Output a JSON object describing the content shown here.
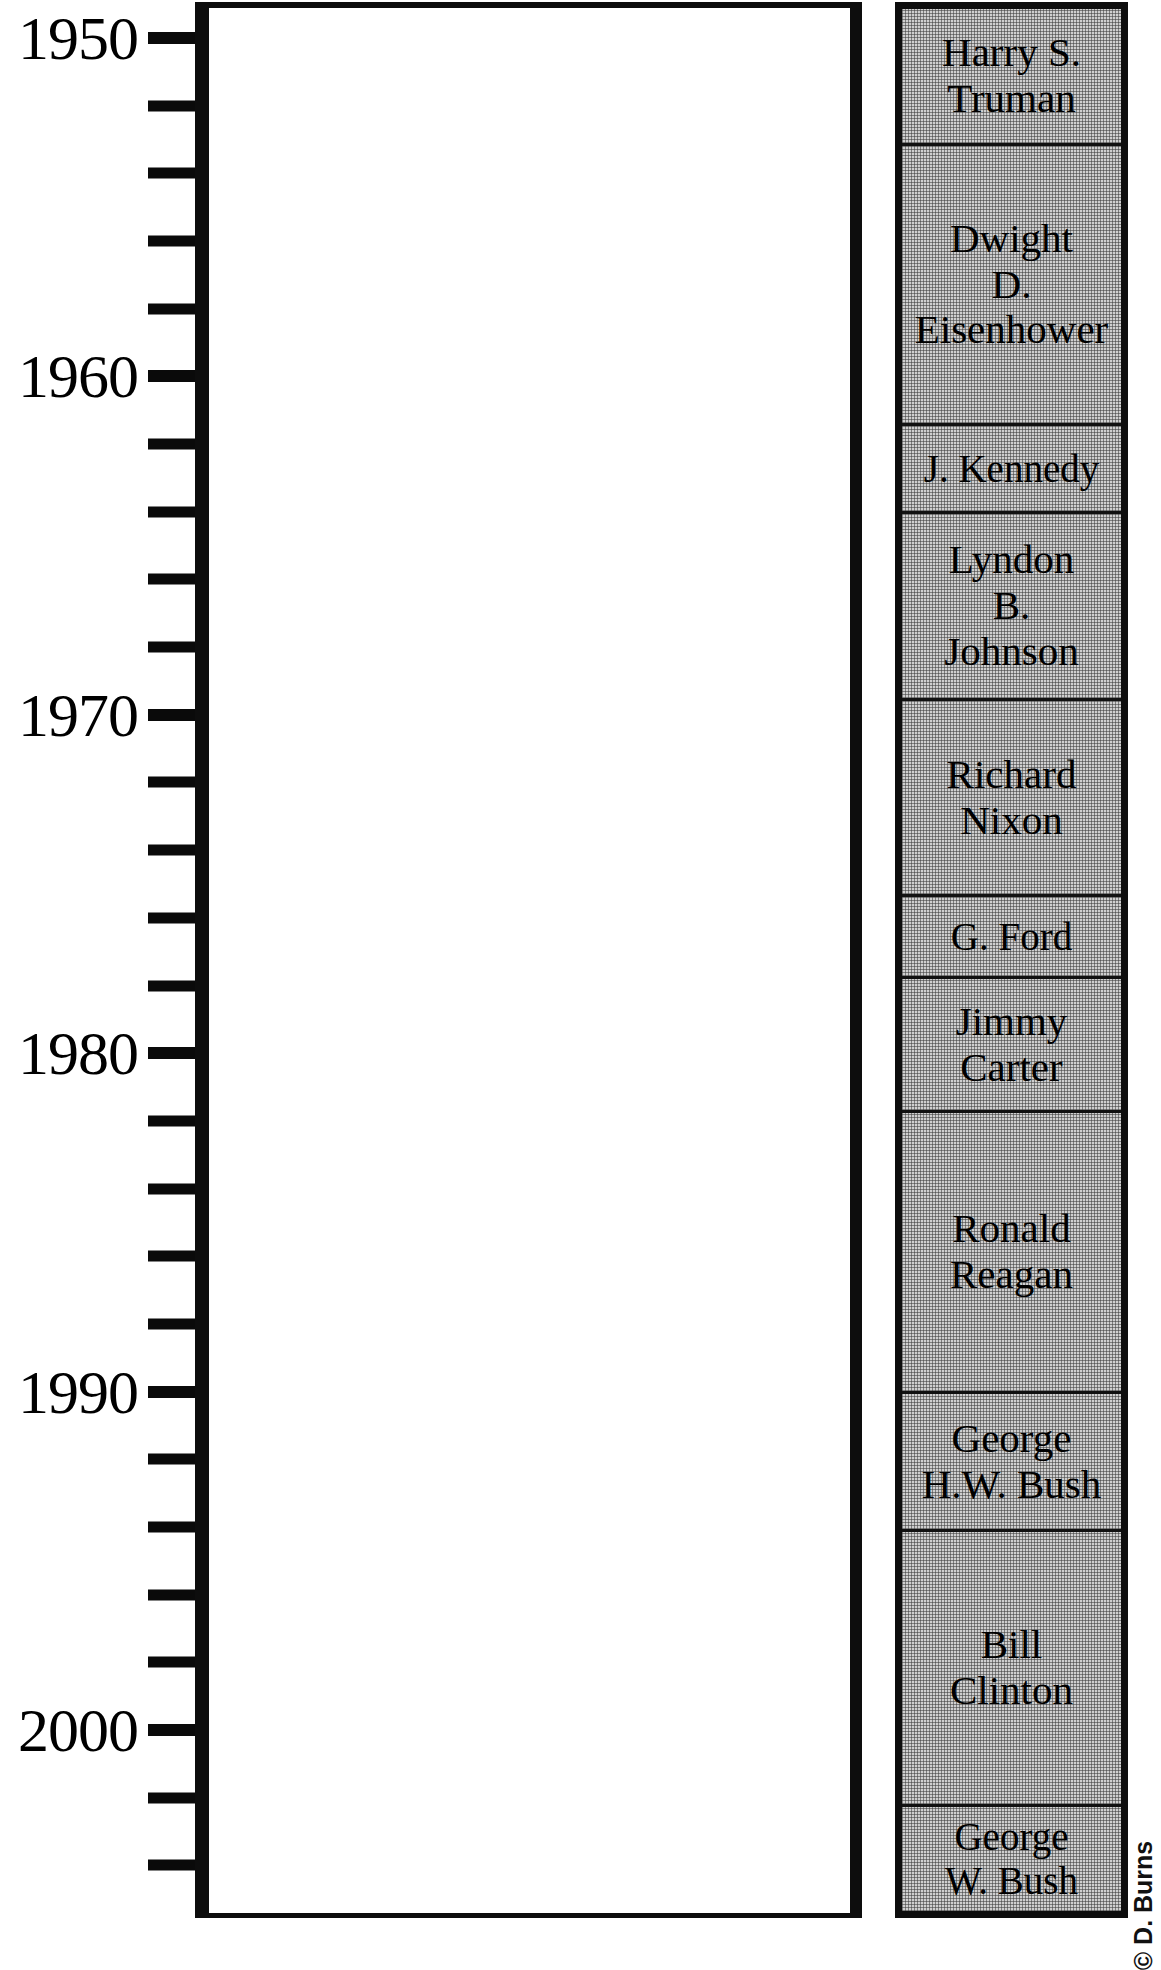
{
  "chart_data": {
    "type": "timeline",
    "title": "",
    "xlabel": "",
    "ylabel": "",
    "axis": {
      "orientation": "vertical",
      "direction": "top-to-bottom",
      "ylim": [
        1948,
        2005.6
      ],
      "major_tick_interval": 10,
      "minor_tick_interval": 2,
      "grid": false,
      "major_tick_labels": [
        "1950",
        "1960",
        "1970",
        "1980",
        "1990",
        "2000"
      ],
      "major_tick_values": [
        1950,
        1960,
        1970,
        1980,
        1990,
        2000
      ],
      "minor_tick_values": [
        1952,
        1954,
        1956,
        1958,
        1962,
        1964,
        1966,
        1968,
        1972,
        1974,
        1976,
        1978,
        1982,
        1984,
        1986,
        1988,
        1992,
        1994,
        1996,
        1998,
        2002,
        2004
      ]
    },
    "legend_position": "right",
    "categories": [
      "Harry S. Truman",
      "Dwight D. Eisenhower",
      "J. Kennedy",
      "Lyndon B. Johnson",
      "Richard Nixon",
      "G. Ford",
      "Jimmy Carter",
      "Ronald Reagan",
      "George H.W. Bush",
      "Bill Clinton",
      "George W. Bush"
    ],
    "series": [
      {
        "name": "Presidential terms",
        "values": [
          {
            "label": "Harry S. Truman",
            "start": 1948.0,
            "end": 1952.0
          },
          {
            "label": "Dwight D. Eisenhower",
            "start": 1952.0,
            "end": 1960.3
          },
          {
            "label": "J. Kennedy",
            "start": 1960.3,
            "end": 1962.9
          },
          {
            "label": "Lyndon B. Johnson",
            "start": 1962.9,
            "end": 1968.4
          },
          {
            "label": "Richard Nixon",
            "start": 1968.4,
            "end": 1974.3
          },
          {
            "label": "G. Ford",
            "start": 1974.3,
            "end": 1976.7
          },
          {
            "label": "Jimmy Carter",
            "start": 1976.7,
            "end": 1980.7
          },
          {
            "label": "Ronald Reagan",
            "start": 1980.7,
            "end": 1989.0
          },
          {
            "label": "George H.W. Bush",
            "start": 1989.0,
            "end": 1993.1
          },
          {
            "label": "Bill Clinton",
            "start": 1993.1,
            "end": 2001.2
          },
          {
            "label": "George W. Bush",
            "start": 2001.2,
            "end": 2005.7
          }
        ]
      }
    ]
  },
  "axis_labels": [
    {
      "text": "1950",
      "year": 1950
    },
    {
      "text": "1960",
      "year": 1960
    },
    {
      "text": "1970",
      "year": 1970
    },
    {
      "text": "1980",
      "year": 1980
    },
    {
      "text": "1990",
      "year": 1990
    },
    {
      "text": "2000",
      "year": 2000
    }
  ],
  "presidents": [
    {
      "name": "Harry S.\nTruman",
      "top": 0,
      "height": 137
    },
    {
      "name": "Dwight\nD.\nEisenhower",
      "top": 137,
      "height": 280
    },
    {
      "name": "J. Kennedy",
      "top": 417,
      "height": 88
    },
    {
      "name": "Lyndon\nB.\nJohnson",
      "top": 505,
      "height": 187
    },
    {
      "name": "Richard\nNixon",
      "top": 692,
      "height": 196
    },
    {
      "name": "G. Ford",
      "top": 888,
      "height": 82
    },
    {
      "name": "Jimmy\nCarter",
      "top": 970,
      "height": 134
    },
    {
      "name": "Ronald\nReagan",
      "top": 1104,
      "height": 281
    },
    {
      "name": "George\nH.W. Bush",
      "top": 1385,
      "height": 138
    },
    {
      "name": "Bill\nClinton",
      "top": 1523,
      "height": 275
    },
    {
      "name": "George\nW. Bush",
      "top": 1798,
      "height": 104
    }
  ],
  "credit": {
    "text": "© D. Burns"
  },
  "colors": {
    "ink": "#0d0d0d",
    "panel_fill": "#c9c9c9",
    "plot_fill": "#ffffff",
    "page_background": "#ffffff"
  }
}
